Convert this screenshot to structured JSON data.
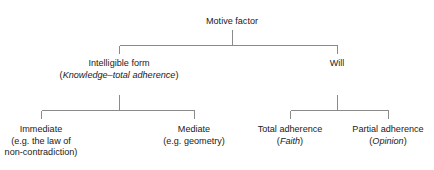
{
  "diagram": {
    "type": "tree",
    "title": "Motive factor",
    "orientation": "top-down",
    "line_color": "#8a8a8a",
    "text_color": "#1a1a1a",
    "background": "#ffffff",
    "nodes": [
      {
        "id": "motive-factor",
        "level": 0,
        "x": 232,
        "y": 16,
        "lines": [
          {
            "text": "Motive factor",
            "style": "regular"
          }
        ]
      },
      {
        "id": "intelligible-form",
        "level": 1,
        "x": 119,
        "y": 58,
        "lines": [
          {
            "text": "Intelligible form",
            "style": "regular"
          },
          {
            "prefix": "(",
            "emphasis": "Knowledge–total adherence",
            "suffix": ")",
            "style": "paren-italic"
          }
        ]
      },
      {
        "id": "will",
        "level": 1,
        "x": 337,
        "y": 58,
        "lines": [
          {
            "text": "Will",
            "style": "regular"
          }
        ]
      },
      {
        "id": "immediate",
        "level": 2,
        "x": 41,
        "y": 124,
        "lines": [
          {
            "text": "Immediate",
            "style": "regular"
          },
          {
            "text": "(e.g. the law of",
            "style": "regular"
          },
          {
            "text": "non-contradiction)",
            "style": "regular"
          }
        ]
      },
      {
        "id": "mediate",
        "level": 2,
        "x": 194,
        "y": 124,
        "lines": [
          {
            "text": "Mediate",
            "style": "regular"
          },
          {
            "text": "(e.g. geometry)",
            "style": "regular"
          }
        ]
      },
      {
        "id": "total-adherence",
        "level": 2,
        "x": 290,
        "y": 124,
        "lines": [
          {
            "text": "Total adherence",
            "style": "regular"
          },
          {
            "prefix": "(",
            "emphasis": "Faith",
            "suffix": ")",
            "style": "paren-italic"
          }
        ]
      },
      {
        "id": "partial-adherence",
        "level": 2,
        "x": 388,
        "y": 124,
        "lines": [
          {
            "text": "Partial adherence",
            "style": "regular"
          },
          {
            "prefix": "(",
            "emphasis": "Opinion",
            "suffix": ")",
            "style": "paren-italic"
          }
        ]
      }
    ],
    "edges": [
      {
        "id": "edge-motive-to-level1",
        "parent": "motive-factor",
        "children": [
          "intelligible-form",
          "will"
        ],
        "stem_top": 30,
        "bus_y": 45,
        "drop_to": 54
      },
      {
        "id": "edge-intelligible-to-leaves",
        "parent": "intelligible-form",
        "children": [
          "immediate",
          "mediate"
        ],
        "stem_top": 95,
        "bus_y": 110,
        "drop_to": 119
      },
      {
        "id": "edge-will-to-leaves",
        "parent": "will",
        "children": [
          "total-adherence",
          "partial-adherence"
        ],
        "stem_top": 95,
        "bus_y": 110,
        "drop_to": 119
      }
    ]
  }
}
